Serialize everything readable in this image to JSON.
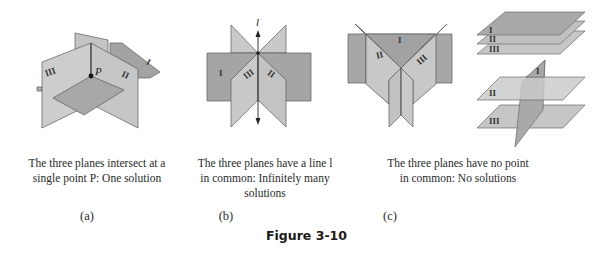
{
  "figure": {
    "title": "Figure 3-10",
    "colors": {
      "light_plane": "#c9c9c9",
      "mid_plane": "#b3b3b3",
      "dark_plane": "#9d9d9d",
      "edge": "#555555",
      "text": "#2a2a2a"
    },
    "panels": [
      {
        "label": "(a)",
        "caption_line1": "The three planes intersect at a",
        "caption_line2": "single point P: One solution",
        "point_label": "P",
        "plane_labels": [
          "I",
          "II",
          "III"
        ]
      },
      {
        "label": "(b)",
        "caption_line1": "The three planes have a line l",
        "caption_line2": "in common: Infinitely many",
        "caption_line3": "solutions",
        "line_label": "l",
        "plane_labels": [
          "I",
          "II",
          "III"
        ]
      },
      {
        "label": "(c)",
        "caption_line1": "The three planes have no point",
        "caption_line2": "in common: No solutions",
        "plane_labels": [
          "I",
          "II",
          "III"
        ]
      }
    ]
  }
}
